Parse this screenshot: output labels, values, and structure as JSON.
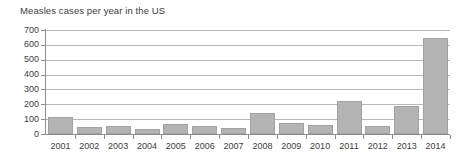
{
  "chart_data": {
    "type": "bar",
    "title": "Measles cases per year in the US",
    "xlabel": "",
    "ylabel": "",
    "categories": [
      "2001",
      "2002",
      "2003",
      "2004",
      "2005",
      "2006",
      "2007",
      "2008",
      "2009",
      "2010",
      "2011",
      "2012",
      "2013",
      "2014"
    ],
    "values": [
      116,
      44,
      56,
      37,
      66,
      55,
      43,
      140,
      71,
      63,
      220,
      55,
      187,
      644
    ],
    "ylim": [
      0,
      700
    ],
    "ytick_labels": [
      "0",
      "100",
      "200",
      "300",
      "400",
      "500",
      "600",
      "700"
    ],
    "ytick_values": [
      0,
      100,
      200,
      300,
      400,
      500,
      600,
      700
    ],
    "grid": true,
    "legend": "none",
    "series": [
      {
        "name": "Measles cases",
        "values": [
          116,
          44,
          56,
          37,
          66,
          55,
          43,
          140,
          71,
          63,
          220,
          55,
          187,
          644
        ]
      }
    ],
    "colors": {
      "bar_fill": "#b4b4b4",
      "bar_stroke": "#a2a2a2",
      "gridline": "#b9b9b9",
      "axis": "#8d8d8d",
      "text": "#3d3d3d",
      "background": "#ffffff"
    }
  }
}
